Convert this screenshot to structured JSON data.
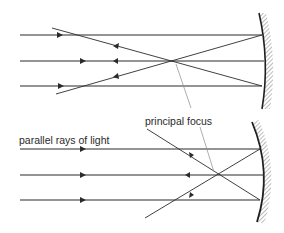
{
  "diagram": {
    "labels": {
      "principal_focus": "principal focus",
      "parallel_rays": "parallel rays of light"
    },
    "colors": {
      "ray": "#2b2b2b",
      "leader": "#8a8a8a",
      "mirror": "#1f1f1f",
      "hatch": "#777777",
      "background": "#ffffff"
    },
    "top_diagram": {
      "incident_ray_y": [
        35,
        61,
        86
      ],
      "focus": [
        171,
        61
      ],
      "mirror_x": 263
    },
    "bottom_diagram": {
      "incident_ray_y": [
        149,
        175,
        200
      ],
      "focus": [
        217,
        175
      ],
      "mirror_x": 262
    }
  }
}
